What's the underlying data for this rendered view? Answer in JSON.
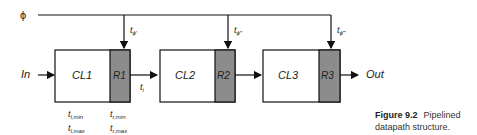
{
  "clock": {
    "label": "ϕ",
    "taps": [
      "t",
      "t",
      "t"
    ],
    "tap_subscripts": [
      "ϕ′",
      "ϕ″",
      "ϕ‴"
    ]
  },
  "input_label": "In",
  "output_label": "Out",
  "stages": [
    {
      "logic": "CL1",
      "register": "R1"
    },
    {
      "logic": "CL2",
      "register": "R2"
    },
    {
      "logic": "CL3",
      "register": "R3"
    }
  ],
  "interstage_label": {
    "base": "t",
    "sub": "i"
  },
  "timing_logic": [
    {
      "base": "t",
      "sub": "l,min"
    },
    {
      "base": "t",
      "sub": "l,max"
    }
  ],
  "timing_register": [
    {
      "base": "t",
      "sub": "r,min"
    },
    {
      "base": "t",
      "sub": "r,max"
    }
  ],
  "caption": {
    "number": "Figure 9.2",
    "line1": "Pipelined",
    "line2": "datapath structure."
  },
  "colors": {
    "register_fill": "#8c8c8c",
    "line": "#111111"
  }
}
